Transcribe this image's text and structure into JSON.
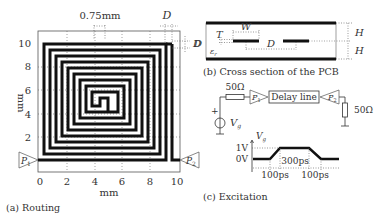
{
  "panel_a": {
    "caption": "(a) Routing",
    "x_label": "mm",
    "y_label": "mm",
    "x_ticks": [
      "0",
      "2",
      "4",
      "6",
      "8",
      "10"
    ],
    "y_ticks": [
      "2",
      "4",
      "6",
      "8",
      "10"
    ],
    "width_annotation": "0.75mm",
    "spacing_annotation": "D",
    "right_annotation": "D",
    "port1": "P",
    "port1_sub": "1",
    "port2": "P",
    "port2_sub": "2"
  },
  "panel_b": {
    "caption": "(b) Cross section of the PCB",
    "labels": {
      "T": "T",
      "W": "W",
      "D_left": "D",
      "D_mid": "D",
      "eps": "ε",
      "eps_sub": "r",
      "H_top": "H",
      "H_bottom": "H"
    }
  },
  "panel_c": {
    "caption": "(c) Excitation",
    "source_resistor": "50Ω",
    "load_resistor": "50Ω",
    "delay_line": "Delay line",
    "source_label": "V",
    "source_sub": "g",
    "plus_sign": "+",
    "port1": "P",
    "port1_sub": "1",
    "port2": "P",
    "port2_sub": "2",
    "waveform": {
      "y_axis_label": "V",
      "y_axis_sub": "g",
      "high_level": "1V",
      "low_level": "0V",
      "rise_time": "100ps",
      "flat_time": "300ps",
      "fall_time": "100ps"
    }
  },
  "colors": {
    "trace": "#111111",
    "frame": "#444444",
    "text": "#333333",
    "guide": "#555555"
  }
}
